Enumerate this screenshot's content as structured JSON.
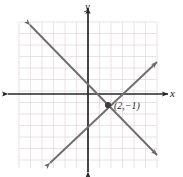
{
  "figure": {
    "kind": "coordinate-plane-graph",
    "width": 183,
    "height": 177,
    "background_color": "#ffffff"
  },
  "axes": {
    "x_axis_label": "x",
    "y_axis_label": "y",
    "axis_color": "#262626",
    "arrowheads": "both-ends-on-both-axes",
    "origin_px": {
      "x": 88,
      "y": 94
    },
    "x_axis_extent_px": {
      "from": 8,
      "to": 168
    },
    "y_axis_extent_px": {
      "from": 8,
      "to": 172
    }
  },
  "grid": {
    "color": "#ead8e0",
    "cell_size_px": 11.5,
    "columns": 12,
    "rows": 12,
    "left_px": 19,
    "top_px": 22,
    "right_px": 157,
    "bottom_px": 168,
    "visible": true
  },
  "chart_data": {
    "type": "line",
    "title": "",
    "xlabel": "x",
    "ylabel": "y",
    "grid": true,
    "legend": "none",
    "xlim": [
      -6,
      6
    ],
    "ylim": [
      -6,
      6
    ],
    "x_tick_labels": [],
    "y_tick_labels": [],
    "series": [
      {
        "name": "descending-line",
        "color": "#6e6e6e",
        "arrowheads": "both",
        "endpoints_px": [
          {
            "x": 30,
            "y": 25
          },
          {
            "x": 157,
            "y": 155
          }
        ],
        "points": [
          {
            "x": -5,
            "y": 6
          },
          {
            "x": 6,
            "y": -5
          }
        ],
        "slope": -1,
        "intercept": 1
      },
      {
        "name": "ascending-line",
        "color": "#6e6e6e",
        "arrowheads": "both",
        "endpoints_px": [
          {
            "x": 50,
            "y": 163
          },
          {
            "x": 157,
            "y": 62
          }
        ],
        "points": [
          {
            "x": -3,
            "y": -6
          },
          {
            "x": 6,
            "y": 2
          }
        ],
        "slope": 1,
        "intercept": -3
      }
    ],
    "annotations": [
      {
        "name": "intersection-point",
        "label": "(2,−1)",
        "x": 2,
        "y": -1,
        "point_px": {
          "x": 108,
          "y": 105
        },
        "label_px": {
          "x": 114,
          "y": 109
        },
        "marker": "filled-dot",
        "marker_color": "#3d3d3d"
      }
    ]
  }
}
